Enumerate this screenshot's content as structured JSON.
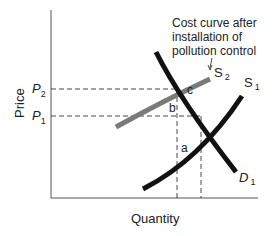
{
  "diagram": {
    "title_annotation": [
      "Cost curve after",
      "installation of",
      "pollution control"
    ],
    "x_axis_label": "Quantity",
    "y_axis_label": "Price",
    "price_levels": [
      {
        "label": "P",
        "sub": "2"
      },
      {
        "label": "P",
        "sub": "1"
      }
    ],
    "curves": [
      {
        "name": "S",
        "sub": "2",
        "color": "#7a7a7a",
        "note": "supply after pollution control"
      },
      {
        "name": "S",
        "sub": "1",
        "color": "#111111"
      },
      {
        "name": "D",
        "sub": "1",
        "color": "#111111"
      }
    ],
    "points": {
      "c": "c",
      "b": "b",
      "a": "a"
    }
  }
}
